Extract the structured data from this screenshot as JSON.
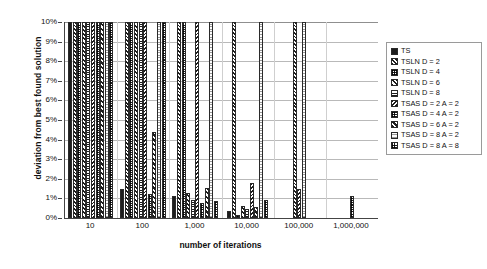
{
  "chart_data": {
    "type": "bar",
    "title": "",
    "xlabel": "number of iterations",
    "ylabel": "deviation from best found solution",
    "categories": [
      "10",
      "100",
      "1,000",
      "10,000",
      "100,000",
      "1,000,000"
    ],
    "ylim": [
      0,
      10
    ],
    "ytick_labels": [
      "10%",
      "9%",
      "8%",
      "7%",
      "6%",
      "5%",
      "4%",
      "3%",
      "2%",
      "1%",
      "0%"
    ],
    "ytick_values": [
      10,
      9,
      8,
      7,
      6,
      5,
      4,
      3,
      2,
      1,
      0
    ],
    "yunit": "%",
    "grid": true,
    "legend_position": "right",
    "note": "bars are clipped at the 10% axis maximum",
    "series": [
      {
        "name": "TS",
        "values": [
          10,
          1.5,
          1.1,
          0.35,
          0.0,
          0.0
        ]
      },
      {
        "name": "TSLN D = 2",
        "values": [
          10,
          10,
          10,
          10,
          10,
          0.0
        ]
      },
      {
        "name": "TSLN D = 4",
        "values": [
          10,
          10,
          10,
          0.15,
          0.0,
          0.0
        ]
      },
      {
        "name": "TSLN D = 6",
        "values": [
          10,
          10,
          1.3,
          0.6,
          0.0,
          0.0
        ]
      },
      {
        "name": "TSLN D = 8",
        "values": [
          10,
          10,
          0.9,
          0.45,
          0.0,
          0.0
        ]
      },
      {
        "name": "TSAS D = 2 A = 2",
        "values": [
          10,
          10,
          10,
          1.8,
          1.5,
          0.0
        ]
      },
      {
        "name": "TSAS D = 4 A = 2",
        "values": [
          10,
          1.2,
          0.75,
          0.0,
          0.0,
          0.0
        ]
      },
      {
        "name": "TSAS D = 6 A = 2",
        "values": [
          10,
          4.4,
          1.55,
          0.55,
          0.0,
          0.0
        ]
      },
      {
        "name": "TSAS D = 8 A = 2",
        "values": [
          10,
          10,
          10,
          10,
          10,
          0.0
        ]
      },
      {
        "name": "TSAS D = 8 A = 8",
        "values": [
          10,
          10,
          0.85,
          0.9,
          0.0,
          1.1
        ]
      }
    ]
  },
  "legend": {
    "items": [
      {
        "label": "TS"
      },
      {
        "label": "TSLN D = 2"
      },
      {
        "label": "TSLN D = 4"
      },
      {
        "label": "TSLN D = 6"
      },
      {
        "label": "TSLN D = 8"
      },
      {
        "label": "TSAS D = 2 A = 2"
      },
      {
        "label": "TSAS D = 4 A = 2"
      },
      {
        "label": "TSAS D = 6 A = 2"
      },
      {
        "label": "TSAS D = 8 A = 2"
      },
      {
        "label": "TSAS D = 8 A = 8"
      }
    ]
  },
  "colors": {
    "ink": "#1d1d1d",
    "axis": "#444444",
    "grid": "#b9b9b9",
    "background": "#ffffff"
  }
}
